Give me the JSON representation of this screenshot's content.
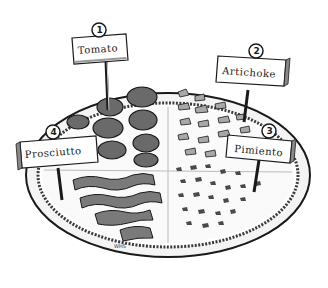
{
  "illustration": {
    "subject": "pizza divided into four topping quadrants with labeled signs",
    "style": "black and white pen-and-ink drawing",
    "colors": {
      "ink": "#1a1a1a",
      "paper": "#ffffff",
      "shade": "#8a8a8a",
      "light_shade": "#cfcfcf"
    }
  },
  "signs": [
    {
      "number": "1",
      "label": "Tomato"
    },
    {
      "number": "2",
      "label": "Artichoke"
    },
    {
      "number": "3",
      "label": "Pimiento"
    },
    {
      "number": "4",
      "label": "Prosciutto"
    }
  ],
  "signature": "WHS"
}
